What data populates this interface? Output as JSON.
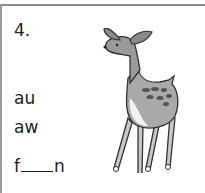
{
  "exercise": {
    "number": "4.",
    "options": [
      "au",
      "aw"
    ],
    "word_prefix": "f",
    "word_suffix": "n",
    "illustration": "fawn-icon"
  }
}
